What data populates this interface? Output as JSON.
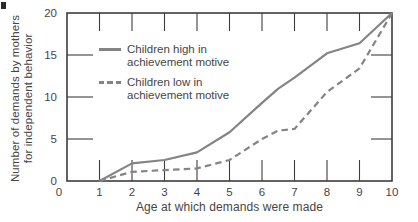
{
  "chart_data": {
    "type": "line",
    "title": "",
    "xlabel": "Age at which demands were made",
    "ylabel": "Number of demands by mothers for independent behavior",
    "ylabel_line1": "Number of demands by mothers",
    "ylabel_line2": "for independent behavior",
    "xlim": [
      0,
      10
    ],
    "ylim": [
      0,
      20
    ],
    "x_ticks": [
      0,
      1,
      2,
      3,
      4,
      5,
      6,
      7,
      8,
      9,
      10
    ],
    "y_ticks": [
      0,
      5,
      10,
      15,
      20
    ],
    "grid": false,
    "legend_position": "upper-left-inside",
    "x": [
      1,
      2,
      3,
      4,
      5,
      6,
      6.5,
      7,
      8,
      9,
      10
    ],
    "series": [
      {
        "name": "Children high in achievement motive",
        "line_style": "solid",
        "values": [
          0,
          2.1,
          2.5,
          3.4,
          5.8,
          9.3,
          11,
          12.3,
          15.2,
          16.4,
          20
        ]
      },
      {
        "name": "Children low in achievement motive",
        "line_style": "dashed",
        "values": [
          0,
          1.1,
          1.3,
          1.5,
          2.5,
          5,
          6,
          6.2,
          10.6,
          13.4,
          20
        ]
      }
    ]
  },
  "legend": {
    "entries": [
      {
        "line1": "Children high in",
        "line2": "achievement motive",
        "style": "solid"
      },
      {
        "line1": "Children low in",
        "line2": "achievement motive",
        "style": "dashed"
      }
    ]
  },
  "colors": {
    "line_gray": "#848484",
    "frame": "#3d3d3d",
    "text": "#464646",
    "background": "#ffffff"
  }
}
